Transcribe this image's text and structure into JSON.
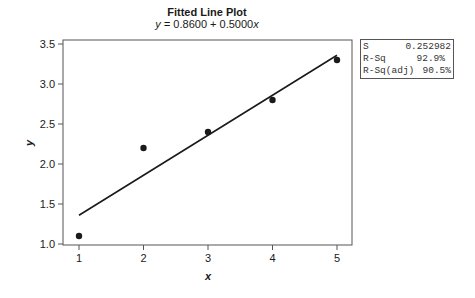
{
  "chart_data": {
    "type": "scatter",
    "title": "Fitted Line Plot",
    "subtitle": "y = 0.8600 + 0.5000x",
    "equation": {
      "intercept": 0.86,
      "slope": 0.5
    },
    "xlabel": "x",
    "ylabel": "y",
    "xlim": [
      0.6,
      5.23
    ],
    "ylim": [
      0.95,
      3.55
    ],
    "x_ticks": [
      1,
      2,
      3,
      4,
      5
    ],
    "y_ticks": [
      1.0,
      1.5,
      2.0,
      2.5,
      3.0,
      3.5
    ],
    "x_tick_labels": [
      "1",
      "2",
      "3",
      "4",
      "5"
    ],
    "y_tick_labels": [
      "1.0",
      "1.5",
      "2.0",
      "2.5",
      "3.0",
      "3.5"
    ],
    "series": [
      {
        "name": "data",
        "type": "scatter",
        "x": [
          1,
          2,
          3,
          4,
          5
        ],
        "y": [
          1.1,
          2.2,
          2.4,
          2.8,
          3.3
        ]
      },
      {
        "name": "fitted line",
        "type": "line",
        "x": [
          1,
          5
        ],
        "y": [
          1.36,
          3.36
        ]
      }
    ],
    "grid": false,
    "stats": [
      {
        "label": "S",
        "value": "0.252982"
      },
      {
        "label": "R-Sq",
        "value": "92.9%"
      },
      {
        "label": "R-Sq(adj)",
        "value": "90.5%"
      }
    ]
  },
  "title": "Fitted Line Plot",
  "subtitle_prefix": "y = ",
  "subtitle_equation": "0.8600 + 0.5000",
  "subtitle_suffix": "x",
  "axes": {
    "xlabel": "x",
    "ylabel": "y"
  },
  "stats_box": {
    "rows": [
      {
        "label": "S",
        "value": "0.252982"
      },
      {
        "label": "R-Sq",
        "value": "92.9%"
      },
      {
        "label": "R-Sq(adj)",
        "value": "90.5%"
      }
    ]
  }
}
